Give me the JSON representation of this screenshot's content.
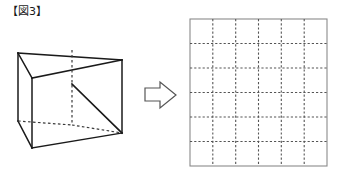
{
  "page": {
    "width": 347,
    "height": 188,
    "background": "#ffffff",
    "title": "【図3】"
  },
  "label": {
    "text": "【図3】",
    "color": "#1a1a1a"
  },
  "cube": {
    "name": "cube-with-diagonal-cut",
    "stroke_solid": "#1a1a1a",
    "stroke_hidden": "#3a3a3a",
    "vertices": {
      "back_top_left": [
        18,
        53
      ],
      "back_top_right": [
        72,
        50
      ],
      "front_top_left": [
        32,
        78
      ],
      "front_top_right": [
        122,
        60
      ],
      "back_bottom_left": [
        18,
        121
      ],
      "back_bottom_right": [
        72,
        125
      ],
      "front_bottom_left": [
        32,
        148
      ],
      "front_bottom_right": [
        122,
        133
      ]
    },
    "solid_edges": [
      {
        "name": "top-back-left-to-top-back-right",
        "from": [
          18,
          53
        ],
        "to": [
          122,
          60
        ]
      },
      {
        "name": "top-left-slant",
        "from": [
          18,
          53
        ],
        "to": [
          32,
          78
        ]
      },
      {
        "name": "top-front-edge",
        "from": [
          32,
          78
        ],
        "to": [
          122,
          60
        ]
      },
      {
        "name": "left-vertical-edge",
        "from": [
          18,
          53
        ],
        "to": [
          18,
          121
        ]
      },
      {
        "name": "front-left-vertical-edge",
        "from": [
          32,
          78
        ],
        "to": [
          32,
          148
        ]
      },
      {
        "name": "right-vertical-edge",
        "from": [
          122,
          60
        ],
        "to": [
          122,
          133
        ]
      },
      {
        "name": "bottom-left-slant",
        "from": [
          18,
          121
        ],
        "to": [
          32,
          148
        ]
      },
      {
        "name": "bottom-front-edge",
        "from": [
          32,
          148
        ],
        "to": [
          122,
          133
        ]
      }
    ],
    "cut_line": {
      "name": "diagonal-cut",
      "from": [
        72,
        84
      ],
      "to": [
        122,
        133
      ]
    },
    "hidden_edges": [
      {
        "name": "hidden-vertical-edge",
        "from": [
          72,
          50
        ],
        "to": [
          72,
          125
        ]
      },
      {
        "name": "hidden-bottom-left-edge",
        "from": [
          18,
          121
        ],
        "to": [
          72,
          125
        ]
      },
      {
        "name": "hidden-bottom-right-edge",
        "from": [
          72,
          125
        ],
        "to": [
          122,
          133
        ]
      }
    ]
  },
  "arrow": {
    "name": "right-arrow",
    "fill": "#ffffff",
    "stroke": "#555555",
    "points": "145,88 160,88 160,82 176,95 160,108 160,101 145,101"
  },
  "grid": {
    "name": "answer-grid",
    "columns": 6,
    "rows": 6,
    "x": 190,
    "y": 19,
    "width": 137,
    "height": 147,
    "border_color": "#8a8a8a",
    "line_color": "#555555",
    "line_style": "dotted",
    "cells_filled": []
  }
}
